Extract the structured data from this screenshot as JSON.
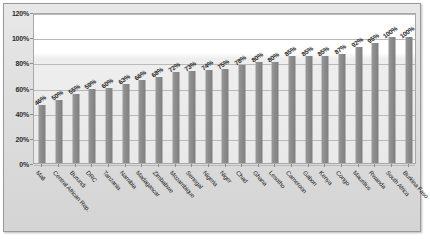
{
  "chart_data": {
    "type": "bar",
    "title": "",
    "subtitle": "",
    "xlabel": "",
    "ylabel": "",
    "ylim": [
      0,
      120
    ],
    "y_tick_labels": [
      "0%",
      "20%",
      "40%",
      "60%",
      "80%",
      "100%",
      "120%"
    ],
    "y_tick_values": [
      0,
      20,
      40,
      60,
      80,
      100,
      120
    ],
    "grid": true,
    "legend": false,
    "legend_position": "none",
    "data_labels_shown": true,
    "bar_color": "#8d8d8d",
    "plot_background": "#ffffff",
    "chart_background": "#e0e0e0",
    "categories": [
      "Mali",
      "Central African Rep.",
      "Burundi",
      "DRC",
      "Tanzania",
      "Namibia",
      "Madagascar",
      "Zimbabwe",
      "Mozambique",
      "Senegal",
      "Nigeria",
      "Niger",
      "Chad",
      "Ghana",
      "Lesotho",
      "Cameroon",
      "Gabon",
      "Kenya",
      "Congo",
      "Mauritius",
      "Rwanda",
      "South Africa",
      "Burkina Faso"
    ],
    "values": [
      46,
      50,
      55,
      59,
      60,
      63,
      66,
      68,
      72,
      73,
      74,
      75,
      78,
      80,
      80,
      85,
      85,
      85,
      87,
      92,
      95,
      100,
      100
    ],
    "value_labels": [
      "46%",
      "50%",
      "55%",
      "59%",
      "60%",
      "63%",
      "66%",
      "68%",
      "72%",
      "73%",
      "74%",
      "75%",
      "78%",
      "80%",
      "80%",
      "85%",
      "85%",
      "85%",
      "87%",
      "92%",
      "95%",
      "100%",
      "100%"
    ]
  }
}
